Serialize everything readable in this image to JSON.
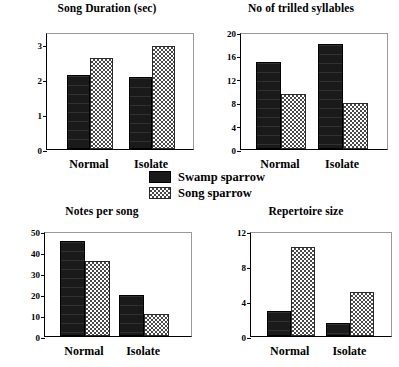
{
  "legend": {
    "entries": [
      {
        "label": "Swamp sparrow",
        "pattern": "solid-black",
        "color": "#1a1a1a"
      },
      {
        "label": "Song sparrow",
        "pattern": "checkered",
        "color": "#4a4a4a"
      }
    ]
  },
  "chart_data": [
    {
      "type": "bar",
      "title": "Song Duration (sec)",
      "xlabel": "",
      "ylabel": "",
      "categories": [
        "Normal",
        "Isolate"
      ],
      "series": [
        {
          "name": "Swamp sparrow",
          "values": [
            2.12,
            2.05
          ]
        },
        {
          "name": "Song sparrow",
          "values": [
            2.6,
            2.95
          ]
        }
      ],
      "yticks": [
        0,
        1,
        2,
        3
      ],
      "ylim": [
        0,
        3.35
      ],
      "grid": false,
      "legend_position": "center-figure"
    },
    {
      "type": "bar",
      "title": "No of trilled syllables",
      "xlabel": "",
      "ylabel": "",
      "categories": [
        "Normal",
        "Isolate"
      ],
      "series": [
        {
          "name": "Swamp sparrow",
          "values": [
            14.8,
            17.9
          ]
        },
        {
          "name": "Song sparrow",
          "values": [
            9.4,
            7.9
          ]
        }
      ],
      "yticks": [
        0,
        4,
        8,
        12,
        16,
        20
      ],
      "ylim": [
        0,
        20
      ],
      "grid": false,
      "legend_position": "center-figure"
    },
    {
      "type": "bar",
      "title": "Notes per song",
      "xlabel": "",
      "ylabel": "",
      "categories": [
        "Normal",
        "Isolate"
      ],
      "series": [
        {
          "name": "Swamp sparrow",
          "values": [
            45.2,
            19.6
          ]
        },
        {
          "name": "Song sparrow",
          "values": [
            35.5,
            10.3
          ]
        }
      ],
      "yticks": [
        0,
        10,
        20,
        30,
        40,
        50
      ],
      "ylim": [
        0,
        50
      ],
      "grid": false,
      "legend_position": "center-figure"
    },
    {
      "type": "bar",
      "title": "Repertoire size",
      "xlabel": "",
      "ylabel": "",
      "categories": [
        "Normal",
        "Isolate"
      ],
      "series": [
        {
          "name": "Swamp sparrow",
          "values": [
            2.9,
            1.5
          ]
        },
        {
          "name": "Song sparrow",
          "values": [
            10.2,
            5.0
          ]
        }
      ],
      "yticks": [
        0,
        4,
        8,
        12
      ],
      "ylim": [
        0,
        12
      ],
      "grid": false,
      "legend_position": "center-figure"
    }
  ]
}
